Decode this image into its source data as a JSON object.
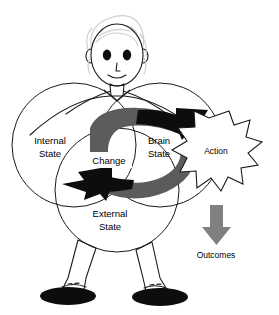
{
  "figure": {
    "person": {
      "name": "cartoon-person",
      "hair_color": "#cfcfcf",
      "outline_color": "#1a1a1a",
      "shoe_color": "#0d0d0d"
    },
    "venn": {
      "circles": [
        {
          "id": "internal",
          "label_line1": "Internal",
          "label_line2": "State",
          "cx": 74,
          "cy": 145,
          "r": 62
        },
        {
          "id": "brain",
          "label_line1": "Brain",
          "label_line2": "State",
          "cx": 160,
          "cy": 145,
          "r": 62
        },
        {
          "id": "external",
          "label_line1": "External",
          "label_line2": "State",
          "cx": 117,
          "cy": 190,
          "r": 62
        }
      ],
      "center_label": "Change"
    },
    "starburst": {
      "label": "Action",
      "fill": "#ffffff",
      "stroke": "#1a1a1a"
    },
    "outcomes": {
      "label": "Outcomes",
      "arrow_color": "#808080",
      "direction": "down"
    },
    "cycle_arrows": [
      {
        "id": "forward-arc",
        "from": "Change",
        "to": "Action",
        "direction": "right",
        "body_color": "#5c5c5c",
        "head_color": "#0d0d0d"
      },
      {
        "id": "return-arc",
        "from": "Action",
        "to": "Change",
        "direction": "left",
        "body_color": "#5c5c5c",
        "head_color": "#0d0d0d"
      }
    ]
  }
}
